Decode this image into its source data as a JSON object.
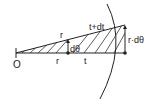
{
  "diagram": {
    "type": "geometric-sector",
    "labels": {
      "origin": "O",
      "upper_r": "r",
      "upper_t": "t+dt",
      "angle": "dθ",
      "lower_r": "r",
      "lower_t": "t",
      "arc_length": "r·dθ"
    },
    "colors": {
      "stroke": "#222222",
      "hatch": "#333333",
      "background": "#ffffff"
    }
  }
}
